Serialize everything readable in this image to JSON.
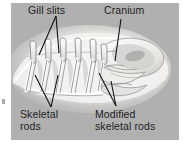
{
  "figure": {
    "panel_background_color": "#b0b0b0",
    "body_color": "#f2f1ee",
    "line_color": "#1a1a1a",
    "page_background_color": "#ffffff"
  },
  "labels": {
    "gill_slits": "Gill slits",
    "cranium": "Cranium",
    "skeletal_rods": "Skeletal\nrods",
    "modified_skeletal_rods": "Modified\nskeletal rods"
  },
  "structures": [
    {
      "name": "gill-slits",
      "count": 6,
      "description": "Row of angled gill bars along the pharynx"
    },
    {
      "name": "cranium",
      "count": 1,
      "description": "Pale cartilaginous braincase at the head end"
    },
    {
      "name": "skeletal-rods",
      "count": 6,
      "description": "Vertical branchial basket rods"
    },
    {
      "name": "modified-skeletal-rods",
      "count": 2,
      "description": "Curved rods supporting the mouth region"
    }
  ],
  "leader_lines": [
    {
      "from": "gill_slits",
      "branches": 2
    },
    {
      "from": "cranium",
      "branches": 1
    },
    {
      "from": "skeletal_rods",
      "branches": 2
    },
    {
      "from": "modified_skeletal_rods",
      "branches": 2
    }
  ]
}
